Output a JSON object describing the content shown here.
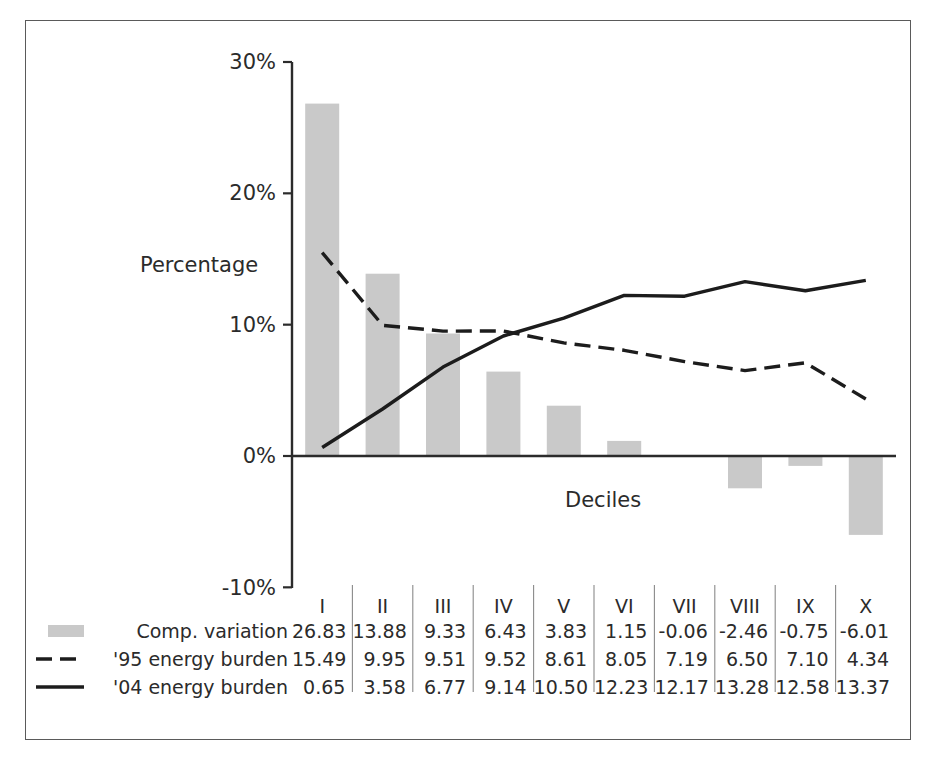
{
  "chart_data": {
    "type": "bar",
    "title": "",
    "subtitle": "",
    "xlabel": "Deciles",
    "ylabel": "Percentage",
    "categories": [
      "I",
      "II",
      "III",
      "IV",
      "V",
      "VI",
      "VII",
      "VIII",
      "IX",
      "X"
    ],
    "ylim": [
      -10,
      30
    ],
    "ytick_labels": [
      "30%",
      "20%",
      "10%",
      "0%",
      "-10%"
    ],
    "ytick_values": [
      30,
      20,
      10,
      0,
      -10
    ],
    "grid": false,
    "legend_position": "bottom-left-table",
    "series": [
      {
        "name": "Comp. variation",
        "type": "bar",
        "marker": "gray-swatch",
        "color": "#c9c9c9",
        "values": [
          26.83,
          13.88,
          9.33,
          6.43,
          3.83,
          1.15,
          -0.06,
          -2.46,
          -0.75,
          -6.01
        ]
      },
      {
        "name": "'95 energy burden",
        "type": "line",
        "marker": "dashed-line",
        "color": "#1c1c1c",
        "values": [
          15.49,
          9.95,
          9.51,
          9.52,
          8.61,
          8.05,
          7.19,
          6.5,
          7.1,
          4.34
        ]
      },
      {
        "name": "'04 energy burden",
        "type": "line",
        "marker": "solid-line",
        "color": "#1c1c1c",
        "values": [
          0.65,
          3.58,
          6.77,
          9.14,
          10.5,
          12.23,
          12.17,
          13.28,
          12.58,
          13.37
        ]
      }
    ]
  },
  "table": {
    "header": [
      "I",
      "II",
      "III",
      "IV",
      "V",
      "VI",
      "VII",
      "VIII",
      "IX",
      "X"
    ],
    "rows": [
      {
        "label": "Comp. variation",
        "marker": "gray-swatch",
        "cells": [
          "26.83",
          "13.88",
          "9.33",
          "6.43",
          "3.83",
          "1.15",
          "-0.06",
          "-2.46",
          "-0.75",
          "-6.01"
        ]
      },
      {
        "label": "'95 energy burden",
        "marker": "dashed-line",
        "cells": [
          "15.49",
          "9.95",
          "9.51",
          "9.52",
          "8.61",
          "8.05",
          "7.19",
          "6.50",
          "7.10",
          "4.34"
        ]
      },
      {
        "label": "'04 energy burden",
        "marker": "solid-line",
        "cells": [
          "0.65",
          "3.58",
          "6.77",
          "9.14",
          "10.50",
          "12.23",
          "12.17",
          "13.28",
          "12.58",
          "13.37"
        ]
      }
    ]
  },
  "colors": {
    "bar_fill": "#c9c9c9",
    "line": "#1c1c1c",
    "axis": "#2b2b2b",
    "frame": "#5a5a5a",
    "text": "#2b2b2b",
    "separator": "#8a8a8a"
  }
}
